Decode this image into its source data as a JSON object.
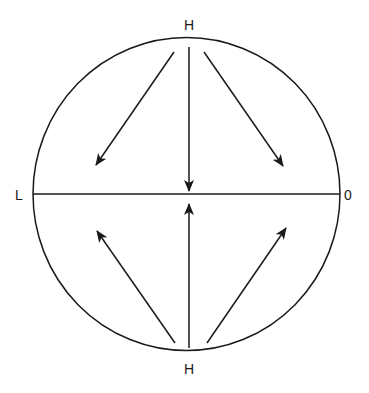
{
  "diagram": {
    "title": "",
    "labels": {
      "top": "H",
      "bottom": "H",
      "left": "L",
      "right": "0"
    },
    "colors": {
      "stroke": "#1a1a1a",
      "background": "#ffffff"
    },
    "circle": {
      "cx": 186.5,
      "cy": 194,
      "rx": 153.5,
      "ry": 156.5
    },
    "axis": {
      "x1": 33,
      "y1": 194,
      "x2": 340,
      "y2": 194
    },
    "arrows": [
      {
        "name": "top-left-arrow",
        "from": [
          174,
          52
        ],
        "to": [
          96,
          165
        ],
        "direction": "down-left"
      },
      {
        "name": "top-center-arrow",
        "from": [
          189,
          47
        ],
        "to": [
          189,
          191
        ],
        "direction": "down"
      },
      {
        "name": "top-right-arrow",
        "from": [
          204,
          52
        ],
        "to": [
          283,
          166
        ],
        "direction": "down-right"
      },
      {
        "name": "bottom-left-arrow",
        "from": [
          175,
          343
        ],
        "to": [
          97,
          231
        ],
        "direction": "up-left"
      },
      {
        "name": "bottom-center-arrow",
        "from": [
          189,
          348
        ],
        "to": [
          189,
          204
        ],
        "direction": "up"
      },
      {
        "name": "bottom-right-arrow",
        "from": [
          207,
          343
        ],
        "to": [
          286,
          228
        ],
        "direction": "up-right"
      }
    ]
  }
}
